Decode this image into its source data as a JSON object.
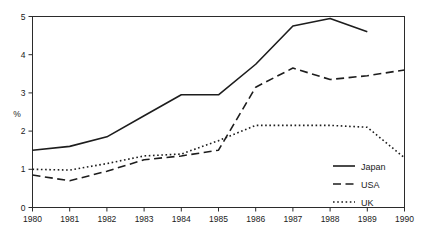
{
  "chart_data": {
    "type": "line",
    "title": "",
    "xlabel": "",
    "ylabel": "%",
    "x": [
      1980,
      1981,
      1982,
      1983,
      1984,
      1985,
      1986,
      1987,
      1988,
      1989,
      1990
    ],
    "xtick_labels": [
      "1980",
      "1981",
      "1982",
      "1983",
      "1984",
      "1985",
      "1986",
      "1987",
      "1988",
      "1989",
      "1990"
    ],
    "ytick_labels": [
      "0",
      "1",
      "2",
      "3",
      "4",
      "5"
    ],
    "yticks": [
      0,
      1,
      2,
      3,
      4,
      5
    ],
    "xlim": [
      1980,
      1990
    ],
    "ylim": [
      0,
      5
    ],
    "grid": false,
    "legend_position": "bottom-right",
    "series": [
      {
        "name": "Japan",
        "style": "solid",
        "x": [
          1980,
          1981,
          1982,
          1983,
          1984,
          1985,
          1986,
          1987,
          1988,
          1989
        ],
        "values": [
          1.5,
          1.6,
          1.85,
          2.4,
          2.95,
          2.95,
          3.75,
          4.75,
          4.95,
          4.6
        ]
      },
      {
        "name": "USA",
        "style": "dashed",
        "x": [
          1980,
          1981,
          1982,
          1983,
          1984,
          1985,
          1986,
          1987,
          1988,
          1989,
          1990
        ],
        "values": [
          0.85,
          0.7,
          0.95,
          1.25,
          1.35,
          1.5,
          3.15,
          3.65,
          3.35,
          3.45,
          3.6
        ]
      },
      {
        "name": "UK",
        "style": "dotted",
        "x": [
          1980,
          1981,
          1982,
          1983,
          1984,
          1985,
          1986,
          1987,
          1988,
          1989,
          1990
        ],
        "values": [
          1.0,
          0.98,
          1.15,
          1.35,
          1.4,
          1.75,
          2.15,
          2.15,
          2.15,
          2.1,
          1.3
        ]
      }
    ]
  },
  "legend": {
    "items": [
      {
        "label": "Japan",
        "style": "solid"
      },
      {
        "label": "USA",
        "style": "dashed"
      },
      {
        "label": "UK",
        "style": "dotted"
      }
    ]
  }
}
